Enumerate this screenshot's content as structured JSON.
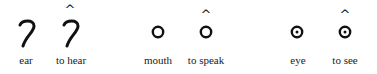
{
  "figure": {
    "items": [
      {
        "label": "ear",
        "symbol": "ear-glyph",
        "caret": false
      },
      {
        "label": "to hear",
        "symbol": "ear-glyph",
        "caret": true,
        "caret_char": "^"
      },
      {
        "label": "mouth",
        "symbol": "circle-glyph",
        "caret": false
      },
      {
        "label": "to speak",
        "symbol": "circle-glyph",
        "caret": true,
        "caret_char": "^"
      },
      {
        "label": "eye",
        "symbol": "dotted-circle-glyph",
        "caret": false
      },
      {
        "label": "to see",
        "symbol": "dotted-circle-glyph",
        "caret": true,
        "caret_char": "^"
      }
    ],
    "colors": {
      "ink": "#111111",
      "background": "#ffffff"
    }
  }
}
